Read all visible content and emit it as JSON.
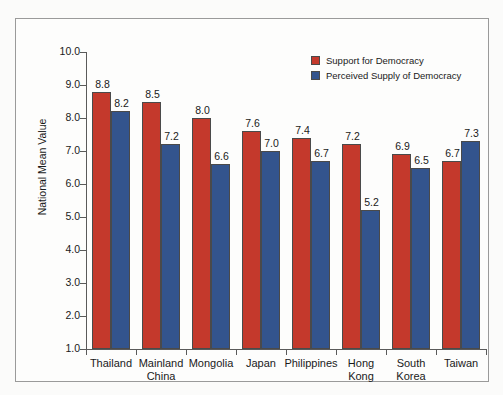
{
  "chart_data": {
    "type": "bar",
    "title": "",
    "xlabel": "",
    "ylabel": "National Mean Value",
    "ylim": [
      1.0,
      10.0
    ],
    "ytick_step": 1.0,
    "yticks": [
      "10.0",
      "9.0",
      "8.0",
      "7.0",
      "6.0",
      "5.0",
      "4.0",
      "3.0",
      "2.0",
      "1.0"
    ],
    "ytick_values": [
      10.0,
      9.0,
      8.0,
      7.0,
      6.0,
      5.0,
      4.0,
      3.0,
      2.0,
      1.0
    ],
    "grid": false,
    "legend_position": "top-right",
    "categories": [
      "Thailand",
      "Mainland China",
      "Mongolia",
      "Japan",
      "Philippines",
      "Hong Kong",
      "South Korea",
      "Taiwan"
    ],
    "category_lines": [
      [
        "Thailand"
      ],
      [
        "Mainland",
        "China"
      ],
      [
        "Mongolia"
      ],
      [
        "Japan"
      ],
      [
        "Philippines"
      ],
      [
        "Hong",
        "Kong"
      ],
      [
        "South",
        "Korea"
      ],
      [
        "Taiwan"
      ]
    ],
    "series": [
      {
        "name": "Support for Democracy",
        "color": "#c4392c",
        "values": [
          8.8,
          8.5,
          8.0,
          7.6,
          7.4,
          7.2,
          6.9,
          6.7
        ],
        "labels": [
          "8.8",
          "8.5",
          "8.0",
          "7.6",
          "7.4",
          "7.2",
          "6.9",
          "6.7"
        ]
      },
      {
        "name": "Perceived Supply of Democracy",
        "color": "#33548d",
        "values": [
          8.2,
          7.2,
          6.6,
          7.0,
          6.7,
          5.2,
          6.5,
          7.3
        ],
        "labels": [
          "8.2",
          "7.2",
          "6.6",
          "7.0",
          "6.7",
          "5.2",
          "6.5",
          "7.3"
        ]
      }
    ]
  },
  "legend": {
    "entries": [
      {
        "label": "Support for Democracy",
        "color": "#c4392c"
      },
      {
        "label": "Perceived Supply of Democracy",
        "color": "#33548d"
      }
    ]
  },
  "axes": {
    "y_title": "National Mean Value"
  },
  "colors": {
    "support": "#c4392c",
    "perceived": "#33548d",
    "frame": "#9a9a9a",
    "axis": "#5a5a5a",
    "text": "#1a1a1a",
    "background": "#fdfdfc"
  }
}
